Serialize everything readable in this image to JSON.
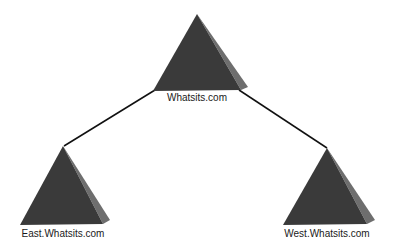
{
  "diagram": {
    "type": "hierarchy",
    "colors": {
      "face": "#3a3a3a",
      "side": "#6e6e6e",
      "line": "#111111",
      "background": "#ffffff"
    },
    "nodes": [
      {
        "id": "root",
        "label": "Whatsits.com"
      },
      {
        "id": "east",
        "label": "East.Whatsits.com"
      },
      {
        "id": "west",
        "label": "West.Whatsits.com"
      }
    ],
    "edges": [
      {
        "from": "root",
        "to": "east"
      },
      {
        "from": "root",
        "to": "west"
      }
    ]
  }
}
